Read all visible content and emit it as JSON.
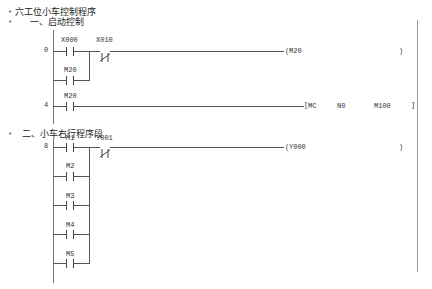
{
  "comments": {
    "title": "六工位小车控制程序",
    "section1": "一、启动控制",
    "section2": "二、小车右行程序段"
  },
  "rungs": [
    {
      "step": "0",
      "contacts": [
        {
          "label": "X000",
          "type": "NO"
        },
        {
          "label": "X010",
          "type": "NC"
        }
      ],
      "parallel": [
        {
          "label": "M20",
          "type": "NO"
        }
      ],
      "output": {
        "type": "coil",
        "open": "(",
        "operand": "M20",
        "close": ")"
      }
    },
    {
      "step": "4",
      "contacts": [
        {
          "label": "M20",
          "type": "NO"
        }
      ],
      "output": {
        "type": "instruction",
        "open": "[",
        "instr": "MC",
        "arg1": "N0",
        "arg2": "M100",
        "close": "]"
      }
    },
    {
      "step": "8",
      "contacts": [
        {
          "label": "M1",
          "type": "NO"
        },
        {
          "label": "Y001",
          "type": "NC"
        }
      ],
      "parallel": [
        {
          "label": "M2",
          "type": "NO"
        },
        {
          "label": "M3",
          "type": "NO"
        },
        {
          "label": "M4",
          "type": "NO"
        },
        {
          "label": "M5",
          "type": "NO"
        }
      ],
      "output": {
        "type": "coil",
        "open": "(",
        "operand": "Y000",
        "close": ")"
      }
    }
  ]
}
